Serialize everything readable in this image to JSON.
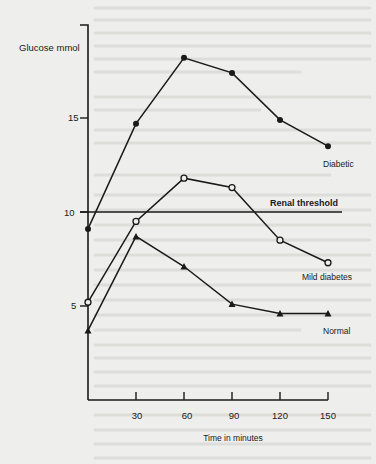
{
  "chart_data": {
    "type": "line",
    "title": "",
    "xlabel": "Time in minutes",
    "ylabel": "Glucose mmol",
    "x": [
      0,
      30,
      60,
      90,
      120,
      150
    ],
    "x_ticks": [
      30,
      60,
      90,
      120,
      150
    ],
    "y_ticks": [
      5,
      10,
      15
    ],
    "xlim": [
      0,
      150
    ],
    "ylim": [
      0,
      19
    ],
    "grid": false,
    "legend": "inline labels at line ends",
    "series": [
      {
        "name": "Diabetic",
        "marker": "filled-circle",
        "values": [
          9.1,
          14.7,
          18.2,
          17.4,
          14.9,
          13.5
        ]
      },
      {
        "name": "Mild diabetes",
        "marker": "open-circle",
        "values": [
          5.2,
          9.5,
          11.8,
          11.3,
          8.5,
          7.3
        ]
      },
      {
        "name": "Normal",
        "marker": "filled-triangle",
        "values": [
          3.7,
          8.7,
          7.1,
          5.1,
          4.6,
          4.6
        ]
      }
    ],
    "annotations": [
      {
        "text": "Renal threshold",
        "type": "horizontal-line",
        "y": 10
      }
    ]
  },
  "labels": {
    "y_axis": "Glucose mmol",
    "x_axis": "Time in minutes",
    "renal_threshold": "Renal threshold",
    "diabetic": "Diabetic",
    "mild_diabetes": "Mild diabetes",
    "normal": "Normal",
    "y_tick_5": "5",
    "y_tick_10": "10",
    "y_tick_15": "15",
    "x_tick_30": "30",
    "x_tick_60": "60",
    "x_tick_90": "90",
    "x_tick_120": "120",
    "x_tick_150": "150"
  },
  "colors": {
    "ink": "#1a1a1a",
    "paper": "#eeeeec"
  }
}
